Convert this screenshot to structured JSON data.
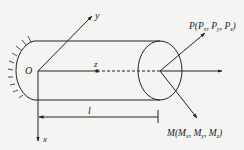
{
  "diagram": {
    "type": "cantilever-beam-coordinate-system",
    "origin_label": "O",
    "axes": {
      "x": "x",
      "y": "y",
      "z": "z"
    },
    "length_label": "l",
    "force_label": {
      "main": "P(",
      "c1": "P",
      "s1": "x",
      "sep1": ", ",
      "c2": "P",
      "s2": "y",
      "sep2": ", ",
      "c3": "P",
      "s3": "z",
      "close": ")"
    },
    "moment_label": {
      "main": "M(",
      "c1": "M",
      "s1": "x",
      "sep1": ", ",
      "c2": "M",
      "s2": "y",
      "sep2": ", ",
      "c3": "M",
      "s3": "z",
      "close": ")"
    },
    "colors": {
      "line": "#222222",
      "background": "#f4f4f2"
    }
  }
}
